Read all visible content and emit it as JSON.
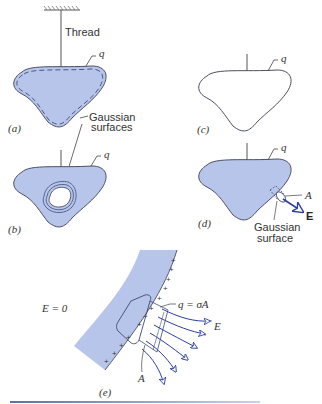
{
  "colors": {
    "conductor_fill": "#b8c5ea",
    "outline": "#4a4f63",
    "arrow": "#2b3fa0",
    "rule": "#7a8bb8"
  },
  "panel_a": {
    "label": "(a)",
    "thread_label": "Thread",
    "charge_label": "q",
    "gaussian_label_line1": "Gaussian",
    "gaussian_label_line2": "surfaces"
  },
  "panel_b": {
    "label": "(b)",
    "charge_label": "q"
  },
  "panel_c": {
    "label": "(c)",
    "charge_label": "q"
  },
  "panel_d": {
    "label": "(d)",
    "charge_label": "q",
    "area_label": "A",
    "field_label": "E",
    "gaussian_label_line1": "Gaussian",
    "gaussian_label_line2": "surface"
  },
  "panel_e": {
    "label": "(e)",
    "inside_field": "E = 0",
    "charge_eq": "q = σA",
    "field_label": "E",
    "area_label": "A",
    "plus_sign": "+"
  }
}
